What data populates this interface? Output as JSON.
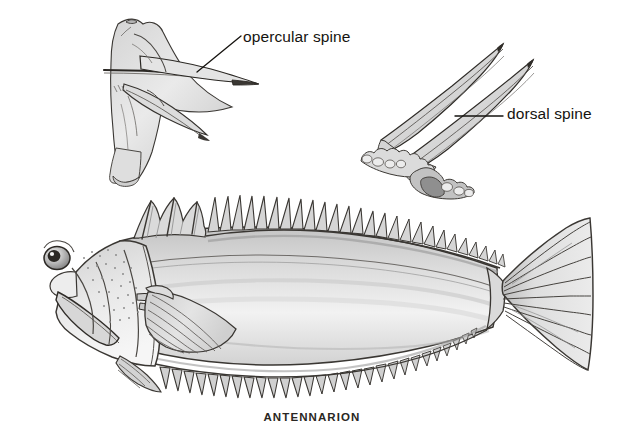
{
  "figure": {
    "kind": "scientific-illustration",
    "medium": "pencil-drawing",
    "background_color": "#ffffff",
    "ink_color": "#15130f",
    "shade_light": "#e6e6e6",
    "shade_mid": "#c9c9c9",
    "shade_dark": "#9a9a9a"
  },
  "labels": {
    "opercular_spine": "opercular spine",
    "dorsal_spine": "dorsal spine"
  },
  "caption": {
    "species": "ANTENNARION",
    "top_partial": ""
  },
  "insets": [
    {
      "name": "opercular-bone-inset",
      "label": "opercular spine",
      "description": "detail of opercular bone with elongate posterior spine"
    },
    {
      "name": "dorsal-spine-inset",
      "label": "dorsal spine",
      "description": "detail of two elongate dorsal fin spines on tuberculate base"
    }
  ],
  "fish": {
    "name": "whole-fish-lateral-view",
    "orientation": "left-facing lateral",
    "parts": [
      "head",
      "eye",
      "mouth",
      "operculum",
      "pectoral-fin",
      "pelvic-fin",
      "spiny-dorsal-fin",
      "soft-dorsal-fin",
      "anal-fin",
      "caudal-peduncle",
      "caudal-fin"
    ],
    "dorsal_spine_count": 26,
    "anal_spine_count": 24,
    "caudal_ray_count": 13
  }
}
